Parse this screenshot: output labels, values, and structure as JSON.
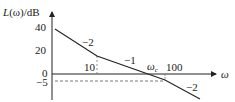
{
  "diagram": {
    "type": "bode-magnitude-asymptotic",
    "y_axis_label": "L(ω)/dB",
    "y_axis_label_parts": {
      "func": "L",
      "arg": "(ω)",
      "unit": "/dB"
    },
    "x_axis_label": "ω",
    "y_ticks": [
      "40",
      "20",
      "0",
      "−5"
    ],
    "x_ticks": [
      "10",
      "100"
    ],
    "crossover_label": "ω",
    "crossover_subscript": "c",
    "slope_labels": [
      "−2",
      "−1",
      "−2"
    ],
    "colors": {
      "line": "#222222",
      "dashed": "#555555"
    }
  }
}
